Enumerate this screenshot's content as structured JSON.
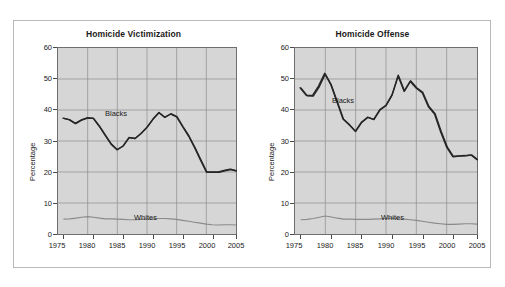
{
  "figure": {
    "panels": [
      {
        "id": "victimization",
        "title": "Homicide Victimization",
        "ylabel": "Percentage",
        "series_labels": {
          "blacks": "Blacks",
          "whites": "Whites"
        }
      },
      {
        "id": "offense",
        "title": "Homicide Offense",
        "ylabel": "Percentage",
        "series_labels": {
          "blacks": "Blacks",
          "whites": "Whites"
        }
      }
    ],
    "ytick_labels": [
      "60",
      "50",
      "40",
      "30",
      "20",
      "10",
      "0"
    ],
    "xtick_labels": [
      "1975",
      "1980",
      "1985",
      "1990",
      "1995",
      "2000",
      "2005"
    ],
    "colors": {
      "plot_background": "#d6d6d6",
      "plot_border": "#6e6e6e",
      "gridline": "#8c8c8c",
      "blacks_line": "#262626",
      "whites_line": "#8a8a8a",
      "frame_border": "#b9b9b9",
      "text": "#1a1a1a"
    }
  },
  "chart_data": [
    {
      "type": "line",
      "title": "Homicide Victimization",
      "xlabel": "",
      "ylabel": "Percentage",
      "xlim": [
        1975,
        2005
      ],
      "ylim": [
        0,
        60
      ],
      "yticks": [
        0,
        10,
        20,
        30,
        40,
        50,
        60
      ],
      "xticks": [
        1975,
        1980,
        1985,
        1990,
        1995,
        2000,
        2005
      ],
      "grid": true,
      "legend": "inline-annotation",
      "x": [
        1976,
        1977,
        1978,
        1979,
        1980,
        1981,
        1982,
        1983,
        1984,
        1985,
        1986,
        1987,
        1988,
        1989,
        1990,
        1991,
        1992,
        1993,
        1994,
        1995,
        1996,
        1997,
        1998,
        1999,
        2000,
        2001,
        2002,
        2003,
        2004,
        2005
      ],
      "series": [
        {
          "name": "Blacks",
          "values": [
            37.3,
            36.8,
            35.6,
            36.7,
            37.4,
            37.3,
            34.8,
            31.9,
            29.0,
            27.2,
            28.4,
            31.1,
            30.8,
            32.4,
            34.4,
            37.0,
            39.1,
            37.6,
            38.7,
            37.8,
            34.6,
            31.6,
            27.9,
            23.9,
            20.0,
            20.0,
            20.0,
            20.5,
            20.9,
            20.4,
            20.6
          ]
        },
        {
          "name": "Whites",
          "values": [
            4.8,
            4.9,
            5.1,
            5.4,
            5.6,
            5.4,
            5.1,
            4.9,
            4.9,
            4.8,
            4.7,
            4.6,
            4.6,
            4.7,
            4.8,
            4.9,
            5.0,
            5.0,
            4.9,
            4.7,
            4.4,
            4.1,
            3.8,
            3.5,
            3.2,
            3.0,
            2.9,
            3.0,
            3.0,
            2.9,
            2.9
          ]
        }
      ]
    },
    {
      "type": "line",
      "title": "Homicide Offense",
      "xlabel": "",
      "ylabel": "Percentage",
      "xlim": [
        1975,
        2005
      ],
      "ylim": [
        0,
        60
      ],
      "yticks": [
        0,
        10,
        20,
        30,
        40,
        50,
        60
      ],
      "xticks": [
        1975,
        1980,
        1985,
        1990,
        1995,
        2000,
        2005
      ],
      "grid": true,
      "legend": "inline-annotation",
      "x": [
        1976,
        1977,
        1978,
        1979,
        1980,
        1981,
        1982,
        1983,
        1984,
        1985,
        1986,
        1987,
        1988,
        1989,
        1990,
        1991,
        1992,
        1993,
        1994,
        1995,
        1996,
        1997,
        1998,
        1999,
        2000,
        2001,
        2002,
        2003,
        2004,
        2005
      ],
      "series": [
        {
          "name": "Blacks",
          "values": [
            47.0,
            44.6,
            44.5,
            47.5,
            51.6,
            48.0,
            42.5,
            37.0,
            35.2,
            33.1,
            36.0,
            37.6,
            36.9,
            40.0,
            41.4,
            44.8,
            51.0,
            46.0,
            49.2,
            47.0,
            45.5,
            41.0,
            38.7,
            33.0,
            28.0,
            25.0,
            25.2,
            25.3,
            25.5,
            24.0,
            26.2
          ]
        },
        {
          "name": "Whites",
          "values": [
            4.6,
            4.7,
            5.0,
            5.4,
            5.8,
            5.5,
            5.1,
            4.8,
            4.8,
            4.7,
            4.7,
            4.7,
            4.8,
            4.9,
            5.0,
            5.1,
            5.0,
            4.8,
            4.6,
            4.4,
            4.1,
            3.8,
            3.5,
            3.3,
            3.1,
            3.1,
            3.2,
            3.3,
            3.3,
            3.2,
            3.4
          ]
        }
      ]
    }
  ]
}
